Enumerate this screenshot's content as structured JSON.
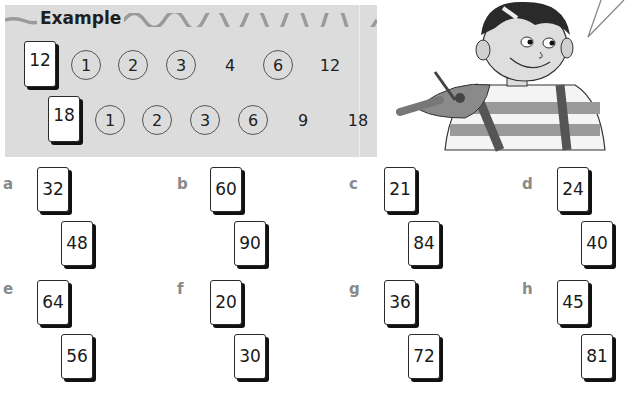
{
  "example": {
    "title": "Example",
    "rows": [
      {
        "card": "12",
        "circled": [
          "1",
          "2",
          "3",
          "6"
        ],
        "items": [
          {
            "value": "1",
            "circled": true
          },
          {
            "value": "2",
            "circled": true
          },
          {
            "value": "3",
            "circled": true
          },
          {
            "value": "4",
            "circled": false
          },
          {
            "value": "6",
            "circled": true
          },
          {
            "value": "12",
            "circled": false
          }
        ]
      },
      {
        "card": "18",
        "items": [
          {
            "value": "1",
            "circled": true
          },
          {
            "value": "2",
            "circled": true
          },
          {
            "value": "3",
            "circled": true
          },
          {
            "value": "6",
            "circled": true
          },
          {
            "value": "9",
            "circled": false
          },
          {
            "value": "18",
            "circled": false
          }
        ]
      }
    ]
  },
  "illustration": {
    "subject": "boy-with-compasses",
    "speech_bubble": "speech-bubble-tail"
  },
  "questions": [
    {
      "label": "a",
      "cards": [
        "32",
        "48"
      ]
    },
    {
      "label": "b",
      "cards": [
        "60",
        "90"
      ]
    },
    {
      "label": "c",
      "cards": [
        "21",
        "84"
      ]
    },
    {
      "label": "d",
      "cards": [
        "24",
        "40"
      ]
    },
    {
      "label": "e",
      "cards": [
        "64",
        "56"
      ]
    },
    {
      "label": "f",
      "cards": [
        "20",
        "30"
      ]
    },
    {
      "label": "g",
      "cards": [
        "36",
        "72"
      ]
    },
    {
      "label": "h",
      "cards": [
        "45",
        "81"
      ]
    }
  ],
  "colors": {
    "panel_bg": "#dcdcdc",
    "label_grey": "#8a8a8a",
    "card_shadow": "#111111"
  }
}
